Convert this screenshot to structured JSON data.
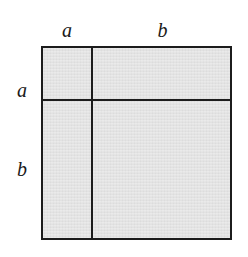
{
  "figure": {
    "name": "binomial-square-diagram",
    "background_color": "#ffffff",
    "fill_color": "#e0e0e0",
    "line_color": "#1c1c1c"
  },
  "labels": {
    "top_left": "a",
    "top_right": "b",
    "left_top": "a",
    "left_bottom": "b"
  },
  "chart_data": {
    "type": "diagram",
    "title": "",
    "subdivision": {
      "columns": [
        {
          "label": "a",
          "width_px": 50
        },
        {
          "label": "b",
          "width_px": 141
        }
      ],
      "rows": [
        {
          "label": "a",
          "height_px": 53
        },
        {
          "label": "b",
          "height_px": 141
        }
      ]
    },
    "cells": [
      {
        "row": "a",
        "column": "a",
        "area": "a^2"
      },
      {
        "row": "a",
        "column": "b",
        "area": "ab"
      },
      {
        "row": "b",
        "column": "a",
        "area": "ab"
      },
      {
        "row": "b",
        "column": "b",
        "area": "b^2"
      }
    ],
    "outer_square": {
      "x": 41,
      "y": 46,
      "width": 191,
      "height": 194
    },
    "divider_vertical_x": 91,
    "divider_horizontal_y": 99,
    "identity": "(a + b)^2 = a^2 + 2ab + b^2"
  }
}
